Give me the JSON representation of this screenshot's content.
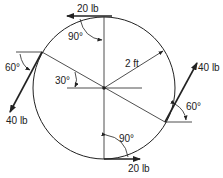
{
  "diagram": {
    "radius_label": "2 ft",
    "forces": [
      {
        "id": "top",
        "label": "20 lb",
        "direction": "left, tangent at top"
      },
      {
        "id": "bottom",
        "label": "20 lb",
        "direction": "right, tangent at bottom"
      },
      {
        "id": "left",
        "label": "40 lb",
        "direction": "down-left at 60° from horizontal"
      },
      {
        "id": "right",
        "label": "40 lb",
        "direction": "up-right at 60° from horizontal"
      }
    ],
    "angles": {
      "top": "90°",
      "bottom": "90°",
      "left": "60°",
      "right": "60°",
      "diameter": "30°"
    },
    "colors": {
      "line": "#222222",
      "background": "#ffffff"
    }
  }
}
